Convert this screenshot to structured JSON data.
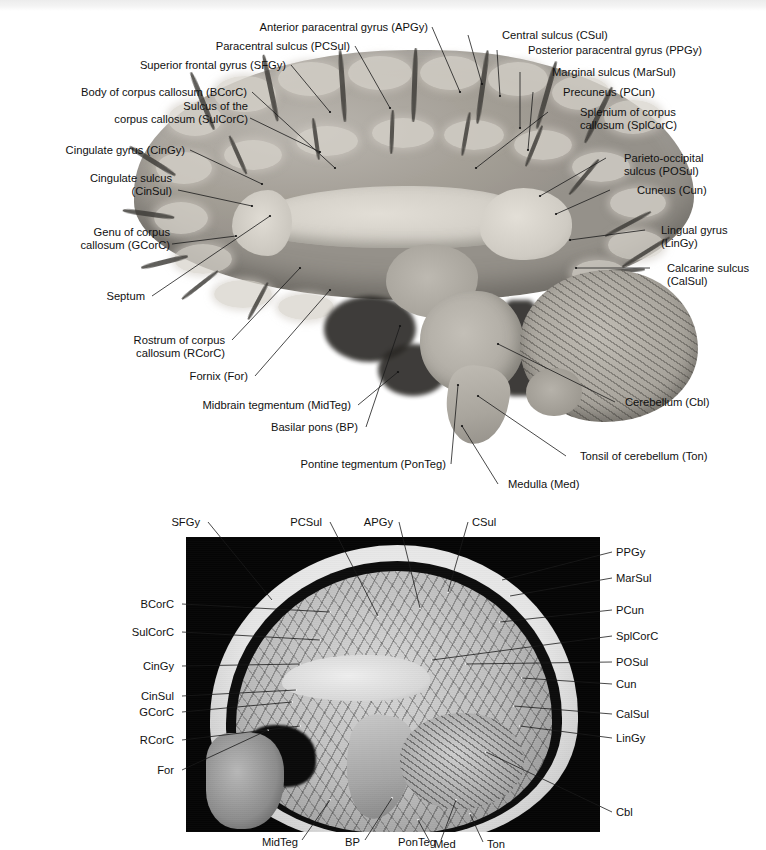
{
  "figure": {
    "type": "anatomical-plate",
    "top_strip_ghost_text": ""
  },
  "panel_a": {
    "name": "midsagittal-brain-specimen-photograph",
    "modality": "gross-anatomy-photograph",
    "labels": [
      {
        "id": "APGy",
        "text": "Anterior paracentral gyrus (APGy)",
        "align": "right",
        "x": 228,
        "y": 21,
        "w": 200,
        "leader": [
          [
            432,
            27
          ],
          [
            460,
            92
          ]
        ]
      },
      {
        "id": "PCSul",
        "text": "Paracentral sulcus (PCSul)",
        "align": "right",
        "x": 185,
        "y": 40,
        "w": 165,
        "leader": [
          [
            355,
            46
          ],
          [
            390,
            108
          ]
        ]
      },
      {
        "id": "CSul",
        "text": "Central sulcus (CSul)",
        "align": "left",
        "x": 502,
        "y": 29,
        "w": 140,
        "leader": [
          [
            468,
            35
          ],
          [
            482,
            84
          ]
        ]
      },
      {
        "id": "PPGy",
        "text": "Posterior paracentral gyrus (PPGy)",
        "align": "left",
        "x": 528,
        "y": 44,
        "w": 190,
        "leader": [
          [
            497,
            50
          ],
          [
            500,
            96
          ]
        ]
      },
      {
        "id": "SFGy",
        "text": "Superior frontal gyrus (SFGy)",
        "align": "right",
        "x": 106,
        "y": 59,
        "w": 180,
        "leader": [
          [
            291,
            65
          ],
          [
            330,
            112
          ]
        ]
      },
      {
        "id": "MarSul",
        "text": "Marginal sulcus (MarSul)",
        "align": "left",
        "x": 552,
        "y": 66,
        "w": 150,
        "leader": [
          [
            520,
            72
          ],
          [
            520,
            128
          ]
        ]
      },
      {
        "id": "BCorC",
        "text": "Body of corpus callosum (BCorC)",
        "align": "right",
        "x": 47,
        "y": 86,
        "w": 200,
        "leader": [
          [
            252,
            92
          ],
          [
            335,
            168
          ]
        ]
      },
      {
        "id": "PCun",
        "text": "Precuneus (PCun)",
        "align": "left",
        "x": 563,
        "y": 86,
        "w": 120,
        "leader": [
          [
            533,
            92
          ],
          [
            528,
            150
          ]
        ]
      },
      {
        "id": "SulCorC",
        "text": "Sulcus of the\ncorpus callosum (SulCorC)",
        "align": "right",
        "x": 38,
        "y": 100,
        "w": 210,
        "leader": [
          [
            250,
            118
          ],
          [
            320,
            152
          ]
        ]
      },
      {
        "id": "SplCorC",
        "text": "Splenium of corpus\ncallosum (SplCorC)",
        "align": "left",
        "x": 580,
        "y": 106,
        "w": 160,
        "leader": [
          [
            548,
            112
          ],
          [
            476,
            168
          ]
        ]
      },
      {
        "id": "CinGy",
        "text": "Cingulate gyrus (CinGy)",
        "align": "right",
        "x": 25,
        "y": 144,
        "w": 160,
        "leader": [
          [
            190,
            150
          ],
          [
            262,
            184
          ]
        ]
      },
      {
        "id": "POSul",
        "text": "Parieto-occipital\nsulcus (POSul)",
        "align": "left",
        "x": 624,
        "y": 152,
        "w": 140,
        "leader": [
          [
            606,
            158
          ],
          [
            540,
            196
          ]
        ]
      },
      {
        "id": "CinSul",
        "text": "Cingulate sulcus\n(CinSul)",
        "align": "right",
        "x": 22,
        "y": 172,
        "w": 150,
        "leader": [
          [
            178,
            190
          ],
          [
            252,
            206
          ]
        ]
      },
      {
        "id": "Cun",
        "text": "Cuneus (Cun)",
        "align": "left",
        "x": 637,
        "y": 184,
        "w": 110,
        "leader": [
          [
            610,
            190
          ],
          [
            556,
            214
          ]
        ]
      },
      {
        "id": "GCorC",
        "text": "Genu of corpus\ncallosum (GCorC)",
        "align": "right",
        "x": 10,
        "y": 226,
        "w": 160,
        "leader": [
          [
            172,
            244
          ],
          [
            236,
            236
          ]
        ]
      },
      {
        "id": "LinGy",
        "text": "Lingual gyrus\n(LinGy)",
        "align": "left",
        "x": 661,
        "y": 224,
        "w": 110,
        "leader": [
          [
            645,
            230
          ],
          [
            570,
            240
          ]
        ]
      },
      {
        "id": "CalSul",
        "text": "Calcarine sulcus\n(CalSul)",
        "align": "left",
        "x": 667,
        "y": 262,
        "w": 110,
        "leader": [
          [
            650,
            268
          ],
          [
            576,
            268
          ]
        ]
      },
      {
        "id": "Septum",
        "text": "Septum",
        "align": "right",
        "x": 45,
        "y": 290,
        "w": 100,
        "leader": [
          [
            152,
            296
          ],
          [
            270,
            216
          ]
        ]
      },
      {
        "id": "RCorC",
        "text": "Rostrum of corpus\ncallosum (RCorC)",
        "align": "right",
        "x": 65,
        "y": 334,
        "w": 160,
        "leader": [
          [
            232,
            340
          ],
          [
            300,
            268
          ]
        ]
      },
      {
        "id": "For",
        "text": "Fornix (For)",
        "align": "right",
        "x": 143,
        "y": 370,
        "w": 105,
        "leader": [
          [
            255,
            376
          ],
          [
            330,
            290
          ]
        ]
      },
      {
        "id": "Cbl",
        "text": "Cerebellum (Cbl)",
        "align": "left",
        "x": 625,
        "y": 396,
        "w": 120,
        "leader": [
          [
            615,
            402
          ],
          [
            498,
            344
          ]
        ]
      },
      {
        "id": "MidTeg",
        "text": "Midbrain tegmentum (MidTeg)",
        "align": "right",
        "x": 166,
        "y": 399,
        "w": 185,
        "leader": [
          [
            358,
            405
          ],
          [
            398,
            372
          ]
        ]
      },
      {
        "id": "BP",
        "text": "Basilar pons (BP)",
        "align": "right",
        "x": 233,
        "y": 421,
        "w": 125,
        "leader": [
          [
            366,
            427
          ],
          [
            400,
            326
          ]
        ]
      },
      {
        "id": "Ton",
        "text": "Tonsil of cerebellum (Ton)",
        "align": "left",
        "x": 580,
        "y": 450,
        "w": 170,
        "leader": [
          [
            566,
            456
          ],
          [
            478,
            396
          ]
        ]
      },
      {
        "id": "PonTeg",
        "text": "Pontine tegmentum (PonTeg)",
        "align": "right",
        "x": 268,
        "y": 458,
        "w": 178,
        "leader": [
          [
            451,
            464
          ],
          [
            458,
            385
          ]
        ]
      },
      {
        "id": "Med",
        "text": "Medulla (Med)",
        "align": "left",
        "x": 508,
        "y": 478,
        "w": 110,
        "leader": [
          [
            498,
            484
          ],
          [
            462,
            426
          ]
        ]
      }
    ]
  },
  "panel_b": {
    "name": "sagittal-mri-scan",
    "modality": "T1-weighted-sagittal-MRI",
    "labels": [
      {
        "id": "SFGy",
        "text": "SFGy",
        "align": "right",
        "x": 150,
        "y": 516,
        "w": 50,
        "leader": [
          [
            208,
            522
          ],
          [
            272,
            600
          ]
        ]
      },
      {
        "id": "PCSul",
        "text": "PCSul",
        "align": "right",
        "x": 272,
        "y": 516,
        "w": 50,
        "leader": [
          [
            330,
            522
          ],
          [
            378,
            616
          ]
        ]
      },
      {
        "id": "APGy",
        "text": "APGy",
        "align": "right",
        "x": 345,
        "y": 516,
        "w": 48,
        "leader": [
          [
            399,
            522
          ],
          [
            420,
            608
          ]
        ]
      },
      {
        "id": "CSul",
        "text": "CSul",
        "align": "left",
        "x": 472,
        "y": 516,
        "w": 46,
        "leader": [
          [
            468,
            522
          ],
          [
            448,
            592
          ]
        ]
      },
      {
        "id": "PPGy",
        "text": "PPGy",
        "align": "left",
        "x": 616,
        "y": 546,
        "w": 50,
        "leader": [
          [
            612,
            552
          ],
          [
            502,
            580
          ]
        ]
      },
      {
        "id": "MarSul",
        "text": "MarSul",
        "align": "left",
        "x": 616,
        "y": 572,
        "w": 58,
        "leader": [
          [
            612,
            578
          ],
          [
            510,
            596
          ]
        ]
      },
      {
        "id": "BCorC",
        "text": "BCorC",
        "align": "right",
        "x": 122,
        "y": 598,
        "w": 52,
        "leader": [
          [
            182,
            604
          ],
          [
            330,
            612
          ]
        ]
      },
      {
        "id": "PCun",
        "text": "PCun",
        "align": "left",
        "x": 616,
        "y": 604,
        "w": 50,
        "leader": [
          [
            612,
            610
          ],
          [
            500,
            622
          ]
        ]
      },
      {
        "id": "SulCorC",
        "text": "SulCorC",
        "align": "right",
        "x": 112,
        "y": 626,
        "w": 62,
        "leader": [
          [
            182,
            632
          ],
          [
            320,
            640
          ]
        ]
      },
      {
        "id": "SplCorC",
        "text": "SplCorC",
        "align": "left",
        "x": 616,
        "y": 630,
        "w": 62,
        "leader": [
          [
            612,
            636
          ],
          [
            432,
            660
          ]
        ]
      },
      {
        "id": "CinGy",
        "text": "CinGy",
        "align": "right",
        "x": 124,
        "y": 660,
        "w": 50,
        "leader": [
          [
            182,
            666
          ],
          [
            300,
            664
          ]
        ]
      },
      {
        "id": "POSul",
        "text": "POSul",
        "align": "left",
        "x": 616,
        "y": 656,
        "w": 52,
        "leader": [
          [
            612,
            662
          ],
          [
            466,
            664
          ]
        ]
      },
      {
        "id": "CinSul",
        "text": "CinSul",
        "align": "right",
        "x": 122,
        "y": 690,
        "w": 52,
        "leader": [
          [
            182,
            696
          ],
          [
            296,
            690
          ]
        ]
      },
      {
        "id": "Cun",
        "text": "Cun",
        "align": "left",
        "x": 616,
        "y": 678,
        "w": 44,
        "leader": [
          [
            612,
            684
          ],
          [
            522,
            678
          ]
        ]
      },
      {
        "id": "GCorC",
        "text": "GCorC",
        "align": "right",
        "x": 118,
        "y": 706,
        "w": 56,
        "leader": [
          [
            182,
            712
          ],
          [
            292,
            702
          ]
        ]
      },
      {
        "id": "CalSul",
        "text": "CalSul",
        "align": "left",
        "x": 616,
        "y": 708,
        "w": 52,
        "leader": [
          [
            612,
            714
          ],
          [
            514,
            706
          ]
        ]
      },
      {
        "id": "RCorC",
        "text": "RCorC",
        "align": "right",
        "x": 120,
        "y": 734,
        "w": 54,
        "leader": [
          [
            182,
            740
          ],
          [
            300,
            726
          ]
        ]
      },
      {
        "id": "LinGy",
        "text": "LinGy",
        "align": "left",
        "x": 616,
        "y": 732,
        "w": 50,
        "leader": [
          [
            612,
            738
          ],
          [
            520,
            726
          ]
        ]
      },
      {
        "id": "For",
        "text": "For",
        "align": "right",
        "x": 140,
        "y": 764,
        "w": 34,
        "leader": [
          [
            182,
            770
          ],
          [
            268,
            730
          ]
        ]
      },
      {
        "id": "Cbl",
        "text": "Cbl",
        "align": "left",
        "x": 616,
        "y": 806,
        "w": 40,
        "leader": [
          [
            612,
            812
          ],
          [
            486,
            752
          ]
        ]
      },
      {
        "id": "MidTeg",
        "text": "MidTeg",
        "align": "right",
        "x": 240,
        "y": 836,
        "w": 58,
        "leader": [
          [
            302,
            840
          ],
          [
            330,
            800
          ]
        ]
      },
      {
        "id": "BP",
        "text": "BP",
        "align": "right",
        "x": 334,
        "y": 836,
        "w": 26,
        "leader": [
          [
            365,
            840
          ],
          [
            392,
            798
          ]
        ]
      },
      {
        "id": "PonTeg",
        "text": "PonTeg",
        "align": "right",
        "x": 380,
        "y": 836,
        "w": 56,
        "leader": [
          [
            441,
            840
          ],
          [
            456,
            800
          ]
        ]
      },
      {
        "id": "Med",
        "text": "Med",
        "align": "left",
        "x": 434,
        "y": 838,
        "w": 40,
        "leader": [
          [
            430,
            842
          ],
          [
            418,
            820
          ]
        ]
      },
      {
        "id": "Ton",
        "text": "Ton",
        "align": "left",
        "x": 487,
        "y": 838,
        "w": 40,
        "leader": [
          [
            483,
            842
          ],
          [
            470,
            814
          ]
        ]
      }
    ]
  },
  "colors": {
    "background": "#ffffff",
    "text": "#111111",
    "leader_line": "#1a1a1a",
    "mri_background": "#050505",
    "mri_leader_line": "#d8d8d8"
  }
}
